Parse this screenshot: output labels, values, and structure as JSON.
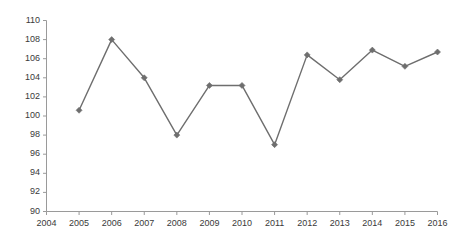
{
  "chart_data": {
    "type": "line",
    "title": "",
    "xlabel": "",
    "ylabel": "",
    "x": [
      2005,
      2006,
      2007,
      2008,
      2009,
      2010,
      2011,
      2012,
      2013,
      2014,
      2015,
      2016
    ],
    "values": [
      100.6,
      108.0,
      104.0,
      98.0,
      103.2,
      103.2,
      97.0,
      106.4,
      103.8,
      106.9,
      105.2,
      106.7
    ],
    "xlim": [
      2004,
      2016
    ],
    "ylim": [
      90,
      110
    ],
    "x_ticks": [
      "2004",
      "2005",
      "2006",
      "2007",
      "2008",
      "2009",
      "2010",
      "2011",
      "2012",
      "2013",
      "2014",
      "2015",
      "2016"
    ],
    "y_ticks": [
      "90",
      "92",
      "94",
      "96",
      "98",
      "100",
      "102",
      "104",
      "106",
      "108",
      "110"
    ],
    "grid": false,
    "legend": false,
    "marker": "diamond",
    "series_color": "#6e6e6e",
    "axis_color": "#9a9a9a",
    "tick_label_color": "#3a3a3a"
  }
}
